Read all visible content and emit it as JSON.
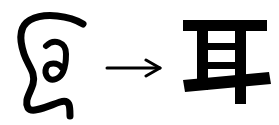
{
  "diagram": {
    "source": {
      "label": "ancient ear pictograph",
      "icon": "ear-pictograph-icon"
    },
    "connector": {
      "icon": "right-arrow-icon",
      "glyph": "→"
    },
    "target": {
      "character": "耳",
      "meaning": "ear"
    },
    "colors": {
      "ink": "#000000",
      "background": "#ffffff"
    }
  }
}
